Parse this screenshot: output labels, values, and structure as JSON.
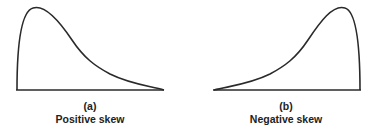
{
  "figures": [
    {
      "letter": "(a)",
      "caption": "Positive skew"
    },
    {
      "letter": "(b)",
      "caption": "Negative skew"
    }
  ],
  "colors": {
    "stroke": "#2a2a2a",
    "text": "#222222"
  }
}
